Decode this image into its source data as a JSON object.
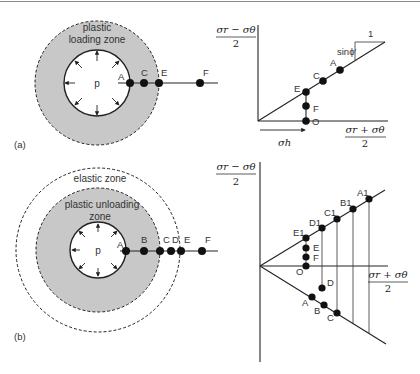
{
  "figure": {
    "panel_a": {
      "tag": "(a)",
      "cavity_label": "p",
      "zone_label_line1": "plastic",
      "zone_label_line2": "loading zone",
      "points": [
        "A",
        "C",
        "E",
        "F"
      ],
      "plot": {
        "y_axis_num": "σr − σθ",
        "y_axis_den": "2",
        "x_axis_num": "σr + σθ",
        "x_axis_den": "2",
        "slope_label": "sinϕ′",
        "slope_run": "1",
        "sigma_h_label": "σh",
        "points": [
          "A",
          "C",
          "E",
          "F",
          "O"
        ]
      }
    },
    "panel_b": {
      "tag": "(b)",
      "cavity_label": "p",
      "elastic_zone_label": "elastic zone",
      "zone_label_line1": "plastic unloading",
      "zone_label_line2": "zone",
      "points": [
        "A",
        "B",
        "C",
        "D",
        "E",
        "F"
      ],
      "plot": {
        "y_axis_num": "σr − σθ",
        "y_axis_den": "2",
        "x_axis_num": "σr + σθ",
        "x_axis_den": "2",
        "upper_points": [
          "E1",
          "D1",
          "C1",
          "B1",
          "A1"
        ],
        "axis_points": [
          "E",
          "F",
          "O"
        ],
        "lower_points": [
          "D",
          "A",
          "B",
          "C"
        ]
      }
    },
    "colors": {
      "plastic_zone_fill": "#c8c8c8",
      "line": "#222222",
      "point": "#111111"
    }
  }
}
